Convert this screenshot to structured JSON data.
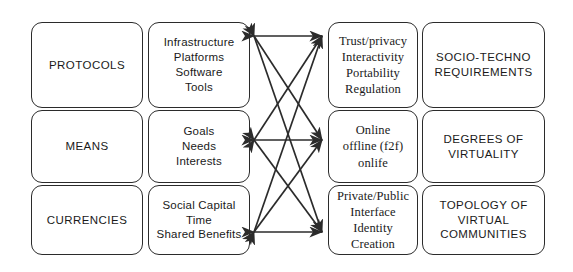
{
  "diagram": {
    "type": "matrix-with-crossing-arrows",
    "stroke_color": "#2b2b2b",
    "background_color": "#ffffff",
    "rows": 3,
    "columns": 4,
    "cells": [
      {
        "id": "r1c1",
        "row": 1,
        "column": 1,
        "style": "sans-caps",
        "lines": [
          "PROTOCOLS"
        ],
        "text": "PROTOCOLS"
      },
      {
        "id": "r1c2",
        "row": 1,
        "column": 2,
        "style": "sans",
        "lines": [
          "Infrastructure",
          "Platforms",
          "Software",
          "Tools"
        ],
        "text": "Infrastructure Platforms Software Tools"
      },
      {
        "id": "r1c3",
        "row": 1,
        "column": 3,
        "style": "serif",
        "lines": [
          "Trust/privacy",
          "Interactivity",
          "Portability",
          "Regulation"
        ],
        "text": "Trust/privacy Interactivity Portability Regulation"
      },
      {
        "id": "r1c4",
        "row": 1,
        "column": 4,
        "style": "sans-caps",
        "lines": [
          "SOCIO-TECHNO",
          "REQUIREMENTS"
        ],
        "text": "SOCIO-TECHNO REQUIREMENTS"
      },
      {
        "id": "r2c1",
        "row": 2,
        "column": 1,
        "style": "sans-caps",
        "lines": [
          "MEANS"
        ],
        "text": "MEANS"
      },
      {
        "id": "r2c2",
        "row": 2,
        "column": 2,
        "style": "sans",
        "lines": [
          "Goals",
          "Needs",
          "Interests"
        ],
        "text": "Goals Needs Interests"
      },
      {
        "id": "r2c3",
        "row": 2,
        "column": 3,
        "style": "serif",
        "lines": [
          "Online",
          "offline (f2f)",
          "onlife"
        ],
        "text": "Online offline (f2f) onlife"
      },
      {
        "id": "r2c4",
        "row": 2,
        "column": 4,
        "style": "sans-caps",
        "lines": [
          "DEGREES OF",
          "VIRTUALITY"
        ],
        "text": "DEGREES OF VIRTUALITY"
      },
      {
        "id": "r3c1",
        "row": 3,
        "column": 1,
        "style": "sans-caps",
        "lines": [
          "CURRENCIES"
        ],
        "text": "CURRENCIES"
      },
      {
        "id": "r3c2",
        "row": 3,
        "column": 2,
        "style": "sans",
        "lines": [
          "Social Capital",
          "Time",
          "Shared Benefits"
        ],
        "text": "Social Capital Time Shared Benefits"
      },
      {
        "id": "r3c3",
        "row": 3,
        "column": 3,
        "style": "serif",
        "lines": [
          "Private/Public",
          "Interface",
          "Identity Creation"
        ],
        "text": "Private/Public Interface Identity Creation"
      },
      {
        "id": "r3c4",
        "row": 3,
        "column": 4,
        "style": "sans-caps",
        "lines": [
          "TOPOLOGY OF",
          "VIRTUAL",
          "COMMUNITIES"
        ],
        "text": "TOPOLOGY OF VIRTUAL COMMUNITIES"
      }
    ],
    "connectors": [
      {
        "id": "c-r1-r1",
        "from": "r1c2",
        "to": "r1c3",
        "kind": "double-arrow",
        "orientation": "horizontal"
      },
      {
        "id": "c-r2-r2",
        "from": "r2c2",
        "to": "r2c3",
        "kind": "double-arrow",
        "orientation": "horizontal"
      },
      {
        "id": "c-r3-r3",
        "from": "r3c2",
        "to": "r3c3",
        "kind": "double-arrow",
        "orientation": "horizontal"
      },
      {
        "id": "c-r1-r2",
        "from": "r1c2",
        "to": "r2c3",
        "kind": "double-arrow",
        "orientation": "diagonal"
      },
      {
        "id": "c-r2-r1",
        "from": "r2c2",
        "to": "r1c3",
        "kind": "double-arrow",
        "orientation": "diagonal"
      },
      {
        "id": "c-r1-r3",
        "from": "r1c2",
        "to": "r3c3",
        "kind": "double-arrow",
        "orientation": "diagonal"
      },
      {
        "id": "c-r3-r1",
        "from": "r3c2",
        "to": "r1c3",
        "kind": "double-arrow",
        "orientation": "diagonal"
      },
      {
        "id": "c-r2-r3",
        "from": "r2c2",
        "to": "r3c3",
        "kind": "double-arrow",
        "orientation": "diagonal"
      },
      {
        "id": "c-r3-r2",
        "from": "r3c2",
        "to": "r2c3",
        "kind": "double-arrow",
        "orientation": "diagonal"
      }
    ]
  }
}
